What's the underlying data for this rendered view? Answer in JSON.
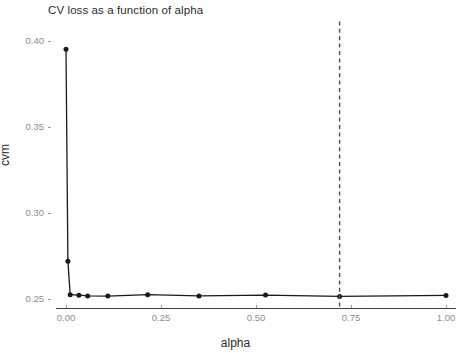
{
  "chart_data": {
    "type": "line",
    "title": "CV loss as a function of alpha",
    "xlabel": "alpha",
    "ylabel": "cvm",
    "xlim": [
      0.0,
      1.0
    ],
    "ylim": [
      0.245,
      0.403
    ],
    "xticks": [
      0.0,
      0.25,
      0.5,
      0.75,
      1.0
    ],
    "xtick_labels": [
      "0.00",
      "0.25",
      "0.50",
      "0.75",
      "1.00"
    ],
    "yticks": [
      0.25,
      0.3,
      0.35,
      0.4
    ],
    "ytick_labels": [
      "0.25",
      "0.30",
      "0.35",
      "0.40"
    ],
    "grid": false,
    "legend": null,
    "series": [
      {
        "name": "cvm",
        "marker": "filled-circle",
        "color": "#1a1a1a",
        "x": [
          0.0,
          0.005,
          0.011,
          0.034,
          0.057,
          0.11,
          0.215,
          0.35,
          0.525,
          0.72,
          1.0
        ],
        "y": [
          0.3952,
          0.272,
          0.2525,
          0.2522,
          0.2518,
          0.2517,
          0.2525,
          0.2518,
          0.2523,
          0.2515,
          0.2521
        ]
      }
    ],
    "annotations": [
      {
        "type": "vertical-reference-line",
        "x": 0.72,
        "style": "dashed",
        "color": "#4d4d4d"
      }
    ]
  },
  "axes": {
    "x_tick_labels": [
      "0.00",
      "0.25",
      "0.50",
      "0.75",
      "1.00"
    ],
    "y_tick_labels": [
      "0.25",
      "0.30",
      "0.35",
      "0.40"
    ]
  }
}
